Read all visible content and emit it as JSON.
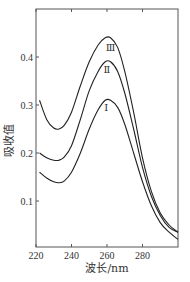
{
  "chart_data": {
    "type": "line",
    "title": "",
    "xlabel": "波长/nm",
    "ylabel": "吸收值",
    "xlim": [
      220,
      300
    ],
    "ylim": [
      0,
      0.5
    ],
    "grid": false,
    "x_ticks": [
      220,
      240,
      260,
      280
    ],
    "x_tick_labels": [
      "220",
      "240",
      "260",
      "280"
    ],
    "y_ticks": [
      0.1,
      0.2,
      0.3,
      0.4
    ],
    "y_tick_labels": [
      "0.1",
      "0.2",
      "0.3",
      "0.4"
    ],
    "series": [
      {
        "name": "Ⅰ",
        "x": [
          222,
          226,
          230,
          233,
          236,
          240,
          245,
          250,
          255,
          259,
          262,
          266,
          270,
          275,
          280,
          285,
          290,
          295,
          300
        ],
        "values": [
          0.16,
          0.148,
          0.14,
          0.138,
          0.142,
          0.16,
          0.2,
          0.25,
          0.29,
          0.31,
          0.31,
          0.295,
          0.26,
          0.2,
          0.14,
          0.09,
          0.055,
          0.035,
          0.02
        ]
      },
      {
        "name": "Ⅱ",
        "x": [
          222,
          226,
          230,
          233,
          236,
          240,
          245,
          250,
          255,
          259,
          262,
          266,
          270,
          275,
          280,
          285,
          290,
          295,
          300
        ],
        "values": [
          0.2,
          0.19,
          0.185,
          0.185,
          0.192,
          0.215,
          0.27,
          0.33,
          0.37,
          0.39,
          0.39,
          0.37,
          0.325,
          0.25,
          0.17,
          0.11,
          0.07,
          0.045,
          0.035
        ]
      },
      {
        "name": "Ⅲ",
        "x": [
          222,
          226,
          230,
          233,
          236,
          240,
          245,
          250,
          255,
          259,
          262,
          266,
          270,
          275,
          280,
          285,
          290,
          295,
          300
        ],
        "values": [
          0.31,
          0.27,
          0.252,
          0.25,
          0.258,
          0.285,
          0.34,
          0.39,
          0.425,
          0.44,
          0.44,
          0.42,
          0.37,
          0.285,
          0.19,
          0.12,
          0.075,
          0.05,
          0.035
        ]
      }
    ],
    "annotations": [
      {
        "text": "Ⅲ",
        "x": 262,
        "y": 0.42
      },
      {
        "text": "Ⅱ",
        "x": 260,
        "y": 0.375
      },
      {
        "text": "Ⅰ",
        "x": 259.5,
        "y": 0.295
      }
    ],
    "legend": "none"
  }
}
